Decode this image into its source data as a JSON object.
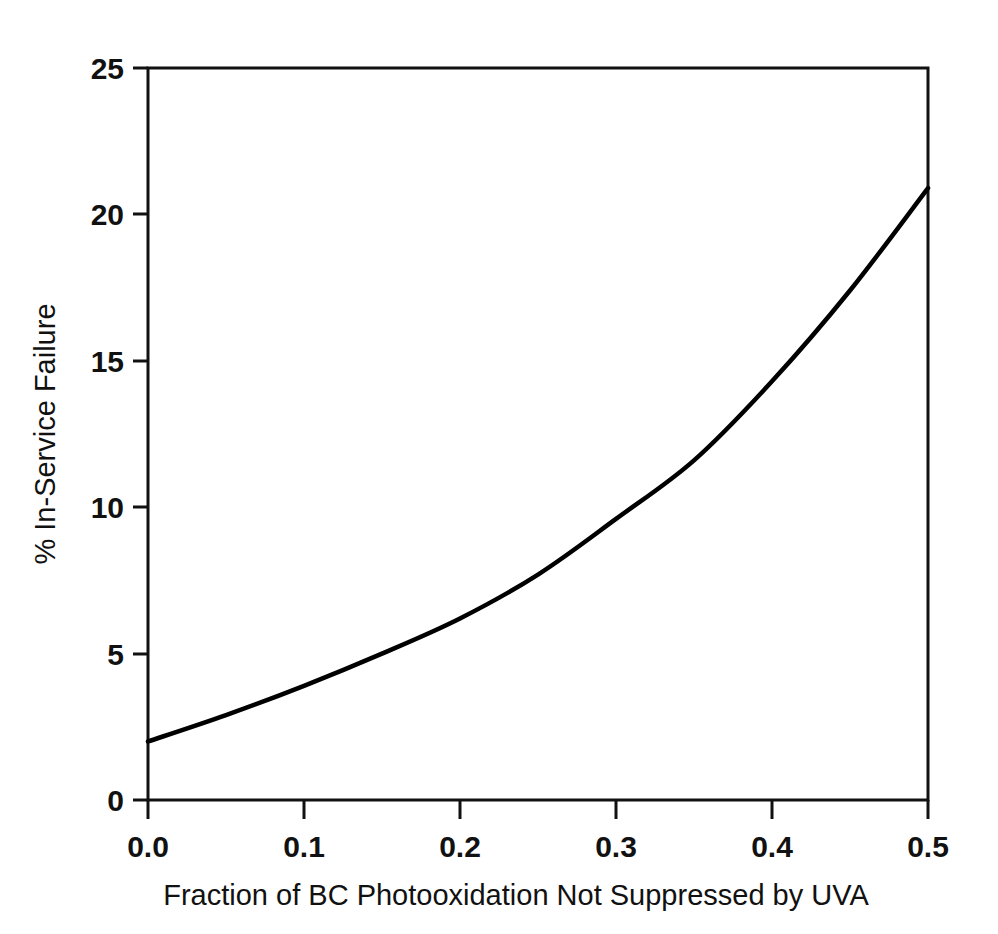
{
  "chart_data": {
    "type": "line",
    "title": "",
    "xlabel": "Fraction of BC Photooxidation Not Suppressed by UVA",
    "ylabel": "% In-Service Failure",
    "xlim": [
      0.0,
      0.5
    ],
    "ylim": [
      0,
      25
    ],
    "grid": false,
    "legend": false,
    "legend_position": "none",
    "line_color": "#000000",
    "background_color": "#ffffff",
    "xticks": [
      0.0,
      0.1,
      0.2,
      0.3,
      0.4,
      0.5
    ],
    "xtick_labels": [
      "0.0",
      "0.1",
      "0.2",
      "0.3",
      "0.4",
      "0.5"
    ],
    "yticks": [
      0,
      5,
      10,
      15,
      20,
      25
    ],
    "ytick_labels": [
      "0",
      "5",
      "10",
      "15",
      "20",
      "25"
    ],
    "series": [
      {
        "name": "In-Service Failure",
        "x": [
          0.0,
          0.05,
          0.1,
          0.15,
          0.2,
          0.25,
          0.3,
          0.35,
          0.4,
          0.45,
          0.5
        ],
        "values": [
          2.0,
          2.9,
          3.9,
          5.0,
          6.2,
          7.7,
          9.6,
          11.6,
          14.3,
          17.4,
          20.9
        ]
      }
    ]
  },
  "axis_titles": {
    "x": "Fraction of BC Photooxidation Not Suppressed by UVA",
    "y": "% In-Service Failure"
  }
}
